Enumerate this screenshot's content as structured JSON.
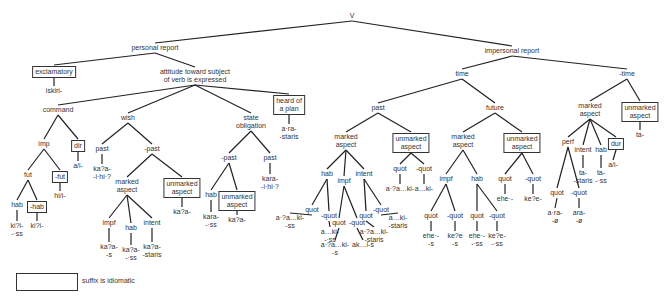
{
  "diagram": {
    "type": "tree",
    "nodes": [
      {
        "id": "v",
        "label": "V",
        "x": 352,
        "y": 12,
        "parent": null
      },
      {
        "id": "pr",
        "label": "personal report",
        "x": 155,
        "y": 44,
        "parent": "v"
      },
      {
        "id": "ipr",
        "label": "impersonal report",
        "x": 512,
        "y": 47,
        "parent": "v"
      },
      {
        "id": "excl",
        "label": "exclamatory",
        "x": 54,
        "y": 66,
        "parent": "pr",
        "boxed": true
      },
      {
        "id": "iskiri",
        "label": "iskiri-",
        "x": 54,
        "y": 87,
        "parent": "excl"
      },
      {
        "id": "att",
        "label": "attitude toward subject\nof verb is expressed",
        "x": 195,
        "y": 68,
        "parent": "pr"
      },
      {
        "id": "cmd",
        "label": "command",
        "x": 58,
        "y": 106,
        "parent": "att"
      },
      {
        "id": "wish",
        "label": "wish",
        "x": 128,
        "y": 114,
        "parent": "att"
      },
      {
        "id": "sob",
        "label": "state\nobligation",
        "x": 251,
        "y": 114,
        "parent": "att"
      },
      {
        "id": "hop",
        "label": "heard of\na plan",
        "x": 289,
        "y": 95,
        "parent": "att",
        "boxed": true
      },
      {
        "id": "arastaris1",
        "label": "a·ra-\n-staris",
        "x": 289,
        "y": 125,
        "parent": "hop"
      },
      {
        "id": "imp",
        "label": "imp",
        "x": 44,
        "y": 140,
        "parent": "cmd"
      },
      {
        "id": "dir",
        "label": "dir",
        "x": 78,
        "y": 140,
        "parent": "cmd",
        "boxed": true
      },
      {
        "id": "ai1",
        "label": "a/i-",
        "x": 78,
        "y": 162,
        "parent": "dir"
      },
      {
        "id": "fut",
        "label": "fut",
        "x": 28,
        "y": 171,
        "parent": "imp"
      },
      {
        "id": "nfut",
        "label": "-fut",
        "x": 60,
        "y": 171,
        "parent": "imp",
        "boxed": true
      },
      {
        "id": "hii",
        "label": "hi/i-",
        "x": 60,
        "y": 192,
        "parent": "nfut"
      },
      {
        "id": "hab1",
        "label": "hab",
        "x": 17,
        "y": 201,
        "parent": "fut"
      },
      {
        "id": "nhab1",
        "label": "-hab",
        "x": 37,
        "y": 201,
        "parent": "fut",
        "boxed": true
      },
      {
        "id": "kiss",
        "label": "ki?i-\n-·ss",
        "x": 17,
        "y": 222,
        "parent": "hab1"
      },
      {
        "id": "ki",
        "label": "ki?i-",
        "x": 37,
        "y": 222,
        "parent": "nhab1"
      },
      {
        "id": "wpast",
        "label": "past",
        "x": 102,
        "y": 145,
        "parent": "wish"
      },
      {
        "id": "kaihi",
        "label": "ka?a-\n-i·hi·?",
        "x": 102,
        "y": 165,
        "parent": "wpast"
      },
      {
        "id": "wnpast",
        "label": "-past",
        "x": 152,
        "y": 145,
        "parent": "wish"
      },
      {
        "id": "wma",
        "label": "marked\naspect",
        "x": 127,
        "y": 178,
        "parent": "wnpast"
      },
      {
        "id": "wua",
        "label": "unmarked\naspect",
        "x": 182,
        "y": 178,
        "parent": "wnpast",
        "boxed": true
      },
      {
        "id": "kaa1",
        "label": "ka?a-",
        "x": 182,
        "y": 208,
        "parent": "wua"
      },
      {
        "id": "wimpf",
        "label": "impf",
        "x": 109,
        "y": 219,
        "parent": "wma"
      },
      {
        "id": "whab",
        "label": "hab",
        "x": 131,
        "y": 224,
        "parent": "wma"
      },
      {
        "id": "wint",
        "label": "intent",
        "x": 152,
        "y": 219,
        "parent": "wma"
      },
      {
        "id": "kas",
        "label": "ka?a-\n-s",
        "x": 109,
        "y": 243,
        "parent": "wimpf"
      },
      {
        "id": "kass",
        "label": "ka?a-\n-·ss",
        "x": 131,
        "y": 246,
        "parent": "whab"
      },
      {
        "id": "kastaris",
        "label": "ka?a-\n-staris",
        "x": 152,
        "y": 243,
        "parent": "wint"
      },
      {
        "id": "snpast",
        "label": "-past",
        "x": 229,
        "y": 154,
        "parent": "sob"
      },
      {
        "id": "spast",
        "label": "past",
        "x": 270,
        "y": 154,
        "parent": "sob"
      },
      {
        "id": "karahi",
        "label": "kara-\n-i·hi·?",
        "x": 270,
        "y": 175,
        "parent": "spast"
      },
      {
        "id": "shab",
        "label": "hab",
        "x": 211,
        "y": 191,
        "parent": "snpast"
      },
      {
        "id": "sua",
        "label": "unmarked\naspect",
        "x": 237,
        "y": 191,
        "parent": "snpast",
        "boxed": true
      },
      {
        "id": "karass",
        "label": "kara-\n-·ss",
        "x": 211,
        "y": 213,
        "parent": "shab"
      },
      {
        "id": "kaa2",
        "label": "ka?a-",
        "x": 237,
        "y": 216,
        "parent": "sua"
      },
      {
        "id": "time",
        "label": "time",
        "x": 462,
        "y": 70,
        "parent": "ipr"
      },
      {
        "id": "ntime",
        "label": "-time",
        "x": 627,
        "y": 70,
        "parent": "ipr"
      },
      {
        "id": "tpast",
        "label": "past",
        "x": 378,
        "y": 104,
        "parent": "time"
      },
      {
        "id": "tfut",
        "label": "future",
        "x": 495,
        "y": 104,
        "parent": "time"
      },
      {
        "id": "pma",
        "label": "marked\naspect",
        "x": 346,
        "y": 133,
        "parent": "tpast"
      },
      {
        "id": "pua",
        "label": "unmarked\naspect",
        "x": 411,
        "y": 133,
        "parent": "tpast",
        "boxed": true
      },
      {
        "id": "puaq",
        "label": "quot",
        "x": 400,
        "y": 165,
        "parent": "pua"
      },
      {
        "id": "puanq",
        "label": "-quot",
        "x": 424,
        "y": 165,
        "parent": "pua"
      },
      {
        "id": "aaki1",
        "label": "a·?a…ki-",
        "x": 400,
        "y": 185,
        "parent": "puaq"
      },
      {
        "id": "aki1",
        "label": "a…ki-",
        "x": 424,
        "y": 185,
        "parent": "puanq"
      },
      {
        "id": "phab",
        "label": "hab",
        "x": 327,
        "y": 170,
        "parent": "pma"
      },
      {
        "id": "pimpf",
        "label": "impf",
        "x": 344,
        "y": 177,
        "parent": "pma"
      },
      {
        "id": "pint",
        "label": "intent",
        "x": 364,
        "y": 170,
        "parent": "pma"
      },
      {
        "id": "phq",
        "label": "quot",
        "x": 312,
        "y": 206,
        "parent": "phab"
      },
      {
        "id": "phnq",
        "label": "-quot",
        "x": 329,
        "y": 212,
        "parent": "phab"
      },
      {
        "id": "aakiss",
        "label": "a·?a…ki-\n-ss",
        "x": 290,
        "y": 214,
        "parent": "phq"
      },
      {
        "id": "akiss",
        "label": "a…ki-\n-·ss",
        "x": 330,
        "y": 228,
        "parent": "phnq"
      },
      {
        "id": "piq",
        "label": "quot",
        "x": 339,
        "y": 219,
        "parent": "pimpf"
      },
      {
        "id": "pinq",
        "label": "-quot",
        "x": 357,
        "y": 219,
        "parent": "pimpf"
      },
      {
        "id": "aakis",
        "label": "a·?a…ki-\n-s",
        "x": 335,
        "y": 241,
        "parent": "piq"
      },
      {
        "id": "akis",
        "label": "ak…i-s",
        "x": 363,
        "y": 241,
        "parent": "pinq"
      },
      {
        "id": "pintq",
        "label": "quot",
        "x": 366,
        "y": 212,
        "parent": "pint"
      },
      {
        "id": "pintnq",
        "label": "-quot",
        "x": 381,
        "y": 206,
        "parent": "pint"
      },
      {
        "id": "aakistaris",
        "label": "a·?a…ki-\n-staris",
        "x": 374,
        "y": 228,
        "parent": "pintq"
      },
      {
        "id": "akistaris",
        "label": "a…ki-\n-staris",
        "x": 398,
        "y": 214,
        "parent": "pintnq"
      },
      {
        "id": "fma",
        "label": "marked\naspect",
        "x": 463,
        "y": 133,
        "parent": "tfut"
      },
      {
        "id": "fua",
        "label": "unmarked\naspect",
        "x": 522,
        "y": 133,
        "parent": "tfut",
        "boxed": true
      },
      {
        "id": "fuaq",
        "label": "quot",
        "x": 505,
        "y": 175,
        "parent": "fua"
      },
      {
        "id": "fuanq",
        "label": "-quot",
        "x": 533,
        "y": 175,
        "parent": "fua"
      },
      {
        "id": "ehe1",
        "label": "ehe·-",
        "x": 505,
        "y": 195,
        "parent": "fuaq"
      },
      {
        "id": "kee1",
        "label": "ke?e-",
        "x": 533,
        "y": 195,
        "parent": "fuanq"
      },
      {
        "id": "fimpf",
        "label": "impf",
        "x": 446,
        "y": 175,
        "parent": "fma"
      },
      {
        "id": "fhab",
        "label": "hab",
        "x": 477,
        "y": 175,
        "parent": "fma"
      },
      {
        "id": "fiq",
        "label": "quot",
        "x": 431,
        "y": 212,
        "parent": "fimpf"
      },
      {
        "id": "finq",
        "label": "-quot",
        "x": 455,
        "y": 212,
        "parent": "fimpf"
      },
      {
        "id": "ehes",
        "label": "ehe·-\n-s",
        "x": 431,
        "y": 232,
        "parent": "fiq"
      },
      {
        "id": "kees",
        "label": "ke?e\n-s",
        "x": 455,
        "y": 232,
        "parent": "finq"
      },
      {
        "id": "fhq",
        "label": "quot",
        "x": 477,
        "y": 212,
        "parent": "fhab"
      },
      {
        "id": "fhnq",
        "label": "-quot",
        "x": 497,
        "y": 212,
        "parent": "fhab"
      },
      {
        "id": "ehess",
        "label": "ehe·-\n-·ss",
        "x": 477,
        "y": 232,
        "parent": "fhq"
      },
      {
        "id": "keess",
        "label": "ke?e-\n-·ss",
        "x": 497,
        "y": 232,
        "parent": "fhnq"
      },
      {
        "id": "nma",
        "label": "marked\naspect",
        "x": 590,
        "y": 102,
        "parent": "ntime"
      },
      {
        "id": "nua",
        "label": "unmarked\naspect",
        "x": 640,
        "y": 102,
        "parent": "ntime",
        "boxed": true
      },
      {
        "id": "ta1",
        "label": "ta-",
        "x": 640,
        "y": 131,
        "parent": "nua"
      },
      {
        "id": "perf",
        "label": "perf",
        "x": 568,
        "y": 138,
        "parent": "nma"
      },
      {
        "id": "nint",
        "label": "intent",
        "x": 583,
        "y": 146,
        "parent": "nma"
      },
      {
        "id": "nhab",
        "label": "hab",
        "x": 601,
        "y": 146,
        "parent": "nma"
      },
      {
        "id": "ndur",
        "label": "dur",
        "x": 616,
        "y": 138,
        "parent": "nma",
        "boxed": true
      },
      {
        "id": "tastaris",
        "label": "ta-\n-staris",
        "x": 583,
        "y": 169,
        "parent": "nint"
      },
      {
        "id": "tass",
        "label": "ta-\n-·ss",
        "x": 601,
        "y": 169,
        "parent": "nhab"
      },
      {
        "id": "ai2",
        "label": "a/i-",
        "x": 613,
        "y": 161,
        "parent": "ndur"
      },
      {
        "id": "pq",
        "label": "quot",
        "x": 557,
        "y": 189,
        "parent": "perf"
      },
      {
        "id": "pnq",
        "label": "-quot",
        "x": 579,
        "y": 189,
        "parent": "perf"
      },
      {
        "id": "araq",
        "label": "a·ra-\n-ø",
        "x": 555,
        "y": 209,
        "parent": "pq"
      },
      {
        "id": "aranq",
        "label": "ara-\n-ø",
        "x": 579,
        "y": 209,
        "parent": "pnq"
      }
    ]
  },
  "legend": {
    "label": "suffix is idiomatic",
    "box_meaning": "boxed node"
  },
  "colors": {
    "line": "#222222",
    "text": "#333333",
    "background": "#ffffff"
  }
}
